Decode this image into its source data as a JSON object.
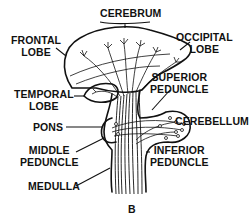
{
  "figure": {
    "panel_label": "B",
    "colors": {
      "ink": "#111111",
      "background": "#ffffff"
    },
    "labels": {
      "cerebrum": "CEREBRUM",
      "frontal_lobe": [
        "FRONTAL",
        "LOBE"
      ],
      "occipital_lobe": [
        "OCCIPITAL",
        "LOBE"
      ],
      "temporal_lobe": [
        "TEMPORAL",
        "LOBE"
      ],
      "superior_peduncle": [
        "SUPERIOR",
        "PEDUNCLE"
      ],
      "cerebellum": "CEREBELLUM",
      "pons": "PONS",
      "middle_peduncle": [
        "MIDDLE",
        "PEDUNCLE"
      ],
      "inferior_peduncle": [
        "INFERIOR",
        "PEDUNCLE"
      ],
      "medulla": "MEDULLA"
    }
  }
}
